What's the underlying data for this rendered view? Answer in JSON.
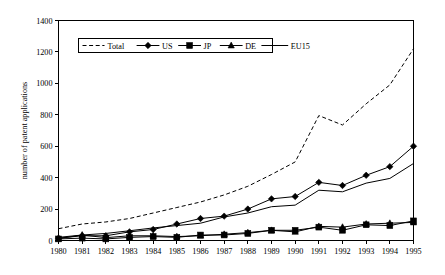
{
  "chart_data": {
    "type": "line",
    "title": "",
    "xlabel": "",
    "ylabel": "number of patent applications",
    "x": [
      1980,
      1981,
      1982,
      1983,
      1984,
      1985,
      1986,
      1987,
      1988,
      1989,
      1990,
      1991,
      1992,
      1993,
      1994,
      1995
    ],
    "xticklabels": [
      "1980",
      "1981",
      "1982",
      "1983",
      "1984",
      "1985",
      "1986",
      "1987",
      "1988",
      "1989",
      "1990",
      "1991",
      "1992",
      "1993",
      "1994",
      "1995"
    ],
    "yticks": [
      0,
      200,
      400,
      600,
      800,
      1000,
      1200,
      1400
    ],
    "yticklabels": [
      "0",
      "200",
      "400",
      "600",
      "800",
      "1000",
      "1200",
      "1400"
    ],
    "ylim": [
      0,
      1400
    ],
    "xlim": [
      1980,
      1995
    ],
    "grid": false,
    "legend_position": "top-left-inside",
    "series": [
      {
        "name": "Total",
        "marker": "none",
        "linestyle": "dashed",
        "color": "#000000",
        "values": [
          75,
          105,
          118,
          140,
          175,
          210,
          245,
          290,
          345,
          420,
          500,
          795,
          735,
          870,
          990,
          1220
        ]
      },
      {
        "name": "US",
        "marker": "diamond",
        "linestyle": "solid",
        "color": "#000000",
        "values": [
          15,
          30,
          30,
          55,
          70,
          105,
          140,
          155,
          200,
          265,
          280,
          370,
          350,
          415,
          470,
          600
        ]
      },
      {
        "name": "JP",
        "marker": "square",
        "linestyle": "solid",
        "color": "#000000",
        "values": [
          10,
          15,
          10,
          20,
          25,
          20,
          35,
          35,
          45,
          65,
          65,
          85,
          65,
          100,
          95,
          125
        ]
      },
      {
        "name": "DE",
        "marker": "triangle",
        "linestyle": "solid",
        "color": "#000000",
        "values": [
          12,
          35,
          18,
          30,
          30,
          25,
          30,
          40,
          50,
          65,
          55,
          90,
          85,
          105,
          110,
          115
        ]
      },
      {
        "name": "EU15",
        "marker": "none",
        "linestyle": "solid",
        "color": "#000000",
        "values": [
          20,
          35,
          45,
          62,
          80,
          95,
          110,
          150,
          175,
          215,
          225,
          320,
          310,
          365,
          395,
          490
        ]
      }
    ]
  },
  "legend": {
    "entries": [
      {
        "label": "Total",
        "marker": "none",
        "linestyle": "dashed"
      },
      {
        "label": "US",
        "marker": "diamond",
        "linestyle": "solid"
      },
      {
        "label": "JP",
        "marker": "square",
        "linestyle": "solid"
      },
      {
        "label": "DE",
        "marker": "triangle",
        "linestyle": "solid"
      },
      {
        "label": "EU15",
        "marker": "none",
        "linestyle": "solid"
      }
    ]
  }
}
